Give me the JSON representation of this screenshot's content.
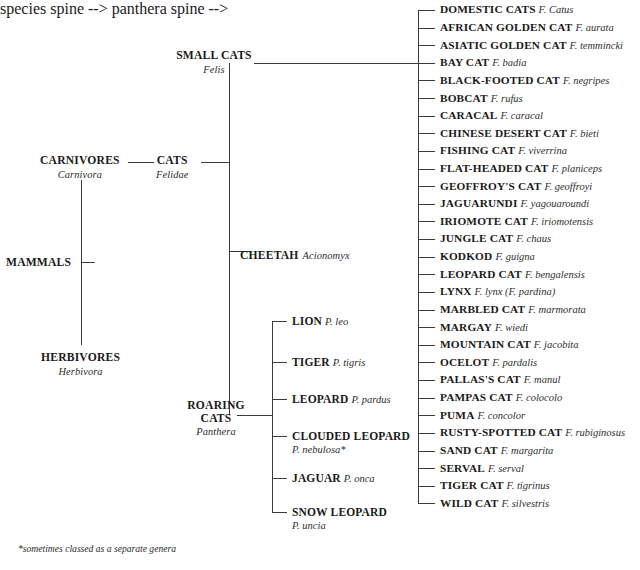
{
  "diagram": {
    "footnote": "*sometimes classed as a separate genera",
    "line_color": "#3a3a3a"
  },
  "root": {
    "label": "MAMMALS"
  },
  "orders": [
    {
      "label": "CARNIVORES",
      "latin": "Carnivora"
    },
    {
      "label": "HERBIVORES",
      "latin": "Herbivora"
    }
  ],
  "family": {
    "label": "CATS",
    "latin": "Felidae"
  },
  "genera": [
    {
      "label": "SMALL CATS",
      "latin": "Felis"
    },
    {
      "label": "CHEETAH",
      "latin": "Acionomyx"
    },
    {
      "label": "ROARING CATS",
      "latin": "Panthera"
    }
  ],
  "small_cats": {
    "genus_label": "SMALL CATS",
    "genus_latin": "Felis",
    "species": [
      {
        "common": "DOMESTIC CATS",
        "latin": "F. Catus"
      },
      {
        "common": "AFRICAN GOLDEN CAT",
        "latin": "F. aurata"
      },
      {
        "common": "ASIATIC GOLDEN CAT",
        "latin": "F. temmincki"
      },
      {
        "common": "BAY CAT",
        "latin": "F. badia"
      },
      {
        "common": "BLACK-FOOTED CAT",
        "latin": "F. negripes"
      },
      {
        "common": "BOBCAT",
        "latin": "F. rufus"
      },
      {
        "common": "CARACAL",
        "latin": "F. caracal"
      },
      {
        "common": "CHINESE DESERT CAT",
        "latin": "F. bieti"
      },
      {
        "common": "FISHING CAT",
        "latin": "F. viverrina"
      },
      {
        "common": "FLAT-HEADED CAT",
        "latin": "F. planiceps"
      },
      {
        "common": "GEOFFROY'S CAT",
        "latin": "F. geoffroyi"
      },
      {
        "common": "JAGUARUNDI",
        "latin": "F. yagouaroundi"
      },
      {
        "common": "IRIOMOTE CAT",
        "latin": "F. iriomotensis"
      },
      {
        "common": "JUNGLE CAT",
        "latin": "F. chaus"
      },
      {
        "common": "KODKOD",
        "latin": "F. guigna"
      },
      {
        "common": "LEOPARD CAT",
        "latin": "F. bengalensis"
      },
      {
        "common": "LYNX",
        "latin": "F. lynx (F. pardina)"
      },
      {
        "common": "MARBLED CAT",
        "latin": "F. marmorata"
      },
      {
        "common": "MARGAY",
        "latin": "F. wiedi"
      },
      {
        "common": "MOUNTAIN CAT",
        "latin": "F. jacobita"
      },
      {
        "common": "OCELOT",
        "latin": "F. pardalis"
      },
      {
        "common": "PALLAS'S CAT",
        "latin": "F. manul"
      },
      {
        "common": "PAMPAS CAT",
        "latin": "F. colocolo"
      },
      {
        "common": "PUMA",
        "latin": "F. concolor"
      },
      {
        "common": "RUSTY-SPOTTED CAT",
        "latin": "F. rubiginosus"
      },
      {
        "common": "SAND CAT",
        "latin": "F. margarita"
      },
      {
        "common": "SERVAL",
        "latin": "F. serval"
      },
      {
        "common": "TIGER CAT",
        "latin": "F. tigrinus"
      },
      {
        "common": "WILD CAT",
        "latin": "F. silvestris"
      }
    ]
  },
  "roaring_cats": {
    "genus_label_line1": "ROARING",
    "genus_label_line2": "CATS",
    "genus_latin": "Panthera",
    "species": [
      {
        "common": "LION",
        "latin": "P. leo",
        "two_line": false
      },
      {
        "common": "TIGER",
        "latin": "P. tigris",
        "two_line": false
      },
      {
        "common": "LEOPARD",
        "latin": "P. pardus",
        "two_line": false
      },
      {
        "common": "CLOUDED LEOPARD",
        "latin": "P. nebulosa*",
        "two_line": true
      },
      {
        "common": "JAGUAR",
        "latin": "P. onca",
        "two_line": false
      },
      {
        "common": "SNOW LEOPARD",
        "latin": "P. uncia",
        "two_line": true
      }
    ]
  },
  "cheetah": {
    "common": "CHEETAH",
    "latin": "Acionomyx"
  }
}
